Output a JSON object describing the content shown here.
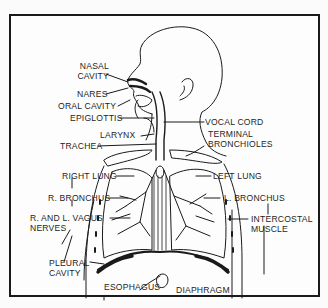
{
  "diagram": {
    "labels": {
      "nasal_cavity_1": "NASAL",
      "nasal_cavity_2": "CAVITY",
      "nares": "NARES",
      "oral_cavity": "ORAL CAVITY",
      "epiglottis": "EPIGLOTTIS",
      "larynx": "LARYNX",
      "trachea": "TRACHEA",
      "vocal_cord": "VOCAL CORD",
      "terminal_bronchioles_1": "TERMINAL",
      "terminal_bronchioles_2": "BRONCHIOLES",
      "right_lung": "RIGHT LUNG",
      "left_lung": "LEFT LUNG",
      "r_bronchus": "R. BRONCHUS",
      "l_bronchus": "L. BRONCHUS",
      "vagus_1": "R. AND L. VAGUS",
      "vagus_2": "NERVES",
      "intercostal_1": "INTERCOSTAL",
      "intercostal_2": "MUSCLE",
      "pleural_1": "PLEURAL",
      "pleural_2": "CAVITY",
      "esophagus": "ESOPHAGUS",
      "diaphragm": "DIAPHRAGM"
    },
    "colors": {
      "ink": "#1a1a1a",
      "paper": "#fdfdfd"
    }
  }
}
